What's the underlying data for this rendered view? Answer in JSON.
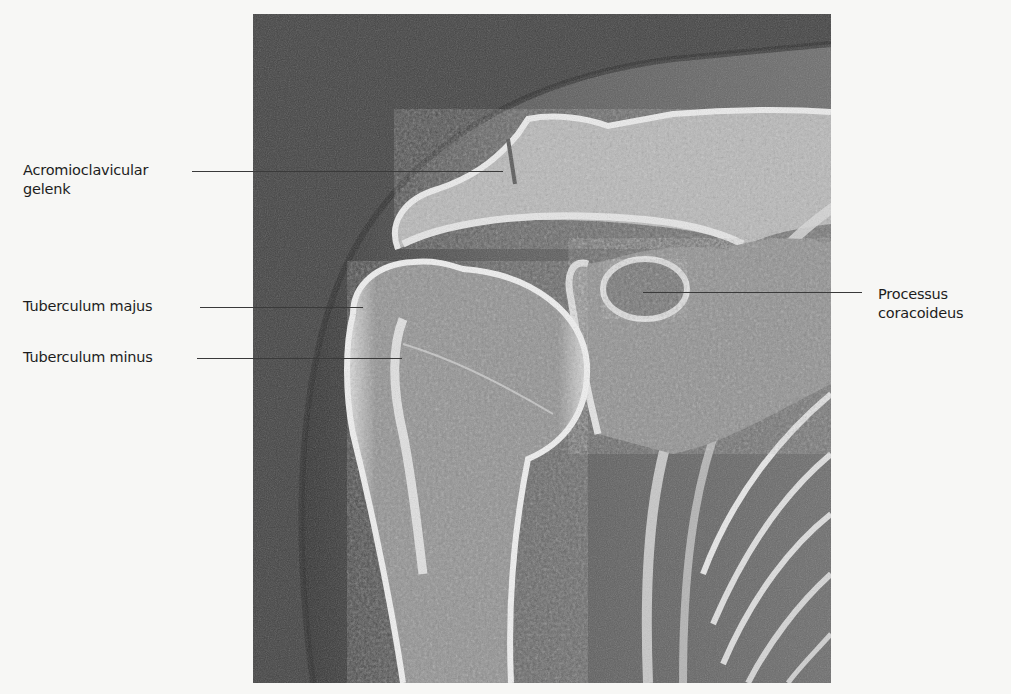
{
  "figure": {
    "image_description": "Shoulder X-ray (AP view)",
    "labels": [
      {
        "id": "acromioclavicular",
        "line1": "Acromioclavicular",
        "line2": "gelenk"
      },
      {
        "id": "tuberculum-majus",
        "line1": "Tuberculum majus"
      },
      {
        "id": "tuberculum-minus",
        "line1": "Tuberculum minus"
      },
      {
        "id": "processus-coracoideus",
        "line1": "Processus",
        "line2": "coracoideus"
      }
    ]
  }
}
